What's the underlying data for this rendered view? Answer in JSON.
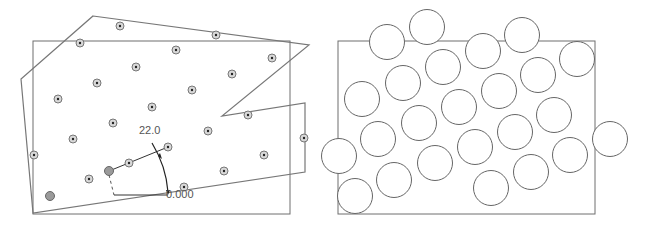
{
  "left_panel": {
    "rect": {
      "x": 33,
      "y": 41,
      "w": 257,
      "h": 173
    },
    "polygon": [
      [
        93,
        16
      ],
      [
        309,
        45
      ],
      [
        222,
        116
      ],
      [
        305,
        103
      ],
      [
        305,
        172
      ],
      [
        33,
        213
      ],
      [
        21,
        79
      ]
    ],
    "points": [
      [
        120,
        26
      ],
      [
        80,
        43
      ],
      [
        216,
        35
      ],
      [
        176,
        50
      ],
      [
        136,
        67
      ],
      [
        272,
        58
      ],
      [
        232,
        74
      ],
      [
        97,
        83
      ],
      [
        192,
        90
      ],
      [
        58,
        99
      ],
      [
        152,
        107
      ],
      [
        248,
        115
      ],
      [
        113,
        123
      ],
      [
        208,
        131
      ],
      [
        73,
        139
      ],
      [
        168,
        147
      ],
      [
        304,
        138
      ],
      [
        34,
        155
      ],
      [
        129,
        163
      ],
      [
        264,
        155
      ],
      [
        89,
        179
      ],
      [
        224,
        171
      ],
      [
        184,
        187
      ]
    ],
    "highlight_points": [
      [
        50,
        196
      ],
      [
        109,
        171
      ]
    ],
    "dimension": {
      "angle_label": "22.0",
      "offset_label": "0.000",
      "origin": [
        109,
        171
      ],
      "vertex": [
        168,
        195
      ]
    }
  },
  "right_panel": {
    "rect": {
      "x": 338,
      "y": 41,
      "w": 257,
      "h": 173
    },
    "circles": [
      [
        387,
        42
      ],
      [
        427,
        27
      ],
      [
        483,
        51
      ],
      [
        522,
        35
      ],
      [
        577,
        59
      ],
      [
        443,
        67
      ],
      [
        403,
        83
      ],
      [
        362,
        99
      ],
      [
        499,
        91
      ],
      [
        538,
        75
      ],
      [
        459,
        107
      ],
      [
        419,
        123
      ],
      [
        378,
        139
      ],
      [
        515,
        132
      ],
      [
        554,
        115
      ],
      [
        475,
        147
      ],
      [
        339,
        156
      ],
      [
        435,
        163
      ],
      [
        394,
        180
      ],
      [
        570,
        155
      ],
      [
        610,
        139
      ],
      [
        531,
        172
      ],
      [
        491,
        188
      ],
      [
        355,
        196
      ]
    ],
    "radius": 17.5
  }
}
